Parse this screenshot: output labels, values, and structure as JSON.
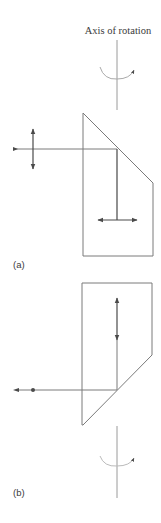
{
  "figure": {
    "axis_title": "Axis of rotation",
    "panels": [
      {
        "label": "(a)",
        "description": "Prism with input beam from left, vertical polarization; reflected down, horizontal polarization"
      },
      {
        "label": "(b)",
        "description": "Inverted prism with vertical polarization going down; reflected beam exits left with out-of-plane polarization (dot)"
      }
    ],
    "colors": {
      "line": "#7a7a7a",
      "arrow": "#4a4a4a",
      "axis": "#9a9a9a",
      "text": "#3a3a3a"
    }
  }
}
